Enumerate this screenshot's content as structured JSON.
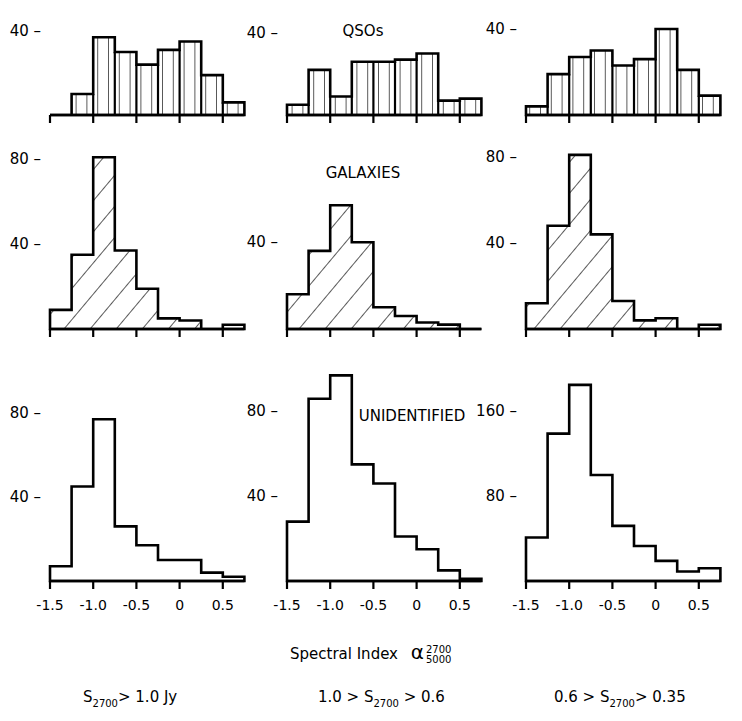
{
  "chart_data": {
    "type": "bar",
    "title": "",
    "xlabel": "Spectral Index α(2700/5000)",
    "bin_edges": [
      -1.5,
      -1.25,
      -1.0,
      -0.75,
      -0.5,
      -0.25,
      0.0,
      0.25,
      0.5,
      0.75
    ],
    "x_ticks": [
      -1.5,
      -1.0,
      -0.5,
      0,
      0.5
    ],
    "x_tick_labels": [
      "-1.5",
      "-1.0",
      "-0.5",
      "0",
      "0.5"
    ],
    "rows": [
      "QSOs",
      "GALAXIES",
      "UNIDENTIFIED"
    ],
    "columns": [
      "S2700 > 1.0 Jy",
      "1.0 > S2700 > 0.6",
      "0.6 > S2700 > 0.35"
    ],
    "panels": [
      {
        "row": "QSOs",
        "column": "S2700 > 1.0 Jy",
        "hatch": "vertical",
        "y_ticks": [
          40
        ],
        "values": [
          0,
          10,
          37,
          30,
          24,
          31,
          35,
          19,
          6
        ]
      },
      {
        "row": "QSOs",
        "column": "1.0 > S2700 > 0.6",
        "hatch": "vertical",
        "y_ticks": [
          40
        ],
        "values": [
          5,
          22,
          9,
          26,
          26,
          27,
          30,
          7,
          8
        ]
      },
      {
        "row": "QSOs",
        "column": "0.6 > S2700 > 0.35",
        "hatch": "vertical",
        "y_ticks": [
          40
        ],
        "values": [
          4,
          19,
          27,
          30,
          23,
          26,
          40,
          21,
          9
        ]
      },
      {
        "row": "GALAXIES",
        "column": "S2700 > 1.0 Jy",
        "hatch": "diagonal",
        "y_ticks": [
          40,
          80
        ],
        "values": [
          9,
          35,
          81,
          37,
          19,
          5,
          4,
          0,
          2
        ]
      },
      {
        "row": "GALAXIES",
        "column": "1.0 > S2700 > 0.6",
        "hatch": "diagonal",
        "y_ticks": [
          40
        ],
        "values": [
          16,
          36,
          57,
          40,
          10,
          6,
          3,
          2,
          0
        ]
      },
      {
        "row": "GALAXIES",
        "column": "0.6 > S2700 > 0.35",
        "hatch": "diagonal",
        "y_ticks": [
          40,
          80
        ],
        "values": [
          12,
          48,
          81,
          44,
          13,
          4,
          5,
          0,
          2
        ]
      },
      {
        "row": "UNIDENTIFIED",
        "column": "S2700 > 1.0 Jy",
        "hatch": "none",
        "y_ticks": [
          40,
          80
        ],
        "values": [
          7,
          45,
          77,
          26,
          17,
          10,
          10,
          4,
          2
        ]
      },
      {
        "row": "UNIDENTIFIED",
        "column": "1.0 > S2700 > 0.6",
        "hatch": "none",
        "y_ticks": [
          40,
          80
        ],
        "values": [
          28,
          86,
          97,
          55,
          46,
          21,
          15,
          5,
          1
        ]
      },
      {
        "row": "UNIDENTIFIED",
        "column": "0.6 > S2700 > 0.35",
        "hatch": "none",
        "y_ticks": [
          80,
          160
        ],
        "values": [
          41,
          139,
          185,
          100,
          52,
          33,
          19,
          9,
          12
        ]
      }
    ],
    "grid": false,
    "legend": null
  },
  "labels": {
    "row_qsos": "QSOs",
    "row_galaxies": "GALAXIES",
    "row_unidentified": "UNIDENTIFIED",
    "xlabel_text": "Spectral Index",
    "xlabel_symbol": "α",
    "xlabel_sup": "2700",
    "xlabel_sub": "5000",
    "col1": {
      "pre": "S",
      "sub": "2700",
      "post": "> 1.0 Jy"
    },
    "col2": {
      "pre": "1.0 > S",
      "sub": "2700",
      "post": " > 0.6"
    },
    "col3": {
      "pre": "0.6 > S",
      "sub": "2700",
      "post": "> 0.35"
    }
  },
  "layout": {
    "col_x0": [
      50,
      287,
      526
    ],
    "bin_px": 21.6,
    "row_base": [
      115,
      329,
      581
    ],
    "row_px_per_unit": [
      [
        2.1,
        2.05,
        2.15
      ],
      [
        2.12,
        2.17,
        2.15
      ],
      [
        2.1,
        2.12,
        1.06
      ]
    ]
  }
}
